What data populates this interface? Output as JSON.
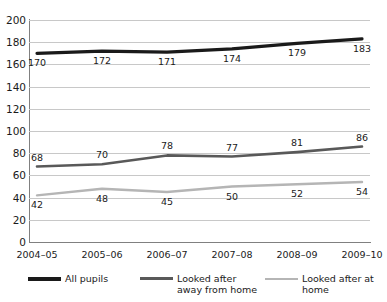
{
  "chart_data": {
    "type": "line",
    "title": "",
    "subtitle": "",
    "xlabel": "",
    "ylabel": "",
    "ylim": [
      0,
      200
    ],
    "ytick_step": 20,
    "yticks": [
      "200",
      "180",
      "160",
      "140",
      "120",
      "100",
      "80",
      "60",
      "40",
      "20",
      "0"
    ],
    "grid": true,
    "legend_position": "bottom",
    "categories": [
      "2004–05",
      "2005–06",
      "2006–07",
      "2007–08",
      "2008–09",
      "2009–10"
    ],
    "series": [
      {
        "name": "All pupils",
        "color": "#1a1a1a",
        "width": 3.2,
        "values": [
          170,
          172,
          171,
          174,
          179,
          183
        ],
        "labels": [
          "170",
          "172",
          "171",
          "174",
          "179",
          "183"
        ]
      },
      {
        "name": "Looked after away from home",
        "color": "#595959",
        "width": 2.6,
        "values": [
          68,
          70,
          78,
          77,
          81,
          86
        ],
        "labels": [
          "68",
          "70",
          "78",
          "77",
          "81",
          "86"
        ]
      },
      {
        "name": "Looked after at home",
        "color": "#b5b5b5",
        "width": 2.4,
        "values": [
          42,
          48,
          45,
          50,
          52,
          54
        ],
        "labels": [
          "42",
          "48",
          "45",
          "50",
          "52",
          "54"
        ]
      }
    ]
  },
  "legend": {
    "items": [
      {
        "label": "All pupils",
        "color": "#1a1a1a"
      },
      {
        "label": "Looked after away from home",
        "color": "#595959"
      },
      {
        "label": "Looked after at home",
        "color": "#b5b5b5"
      }
    ]
  },
  "colors": {
    "background": "#ffffff",
    "gridline": "#c8c8c8",
    "axis": "#808080",
    "text": "#1a1a1a"
  }
}
